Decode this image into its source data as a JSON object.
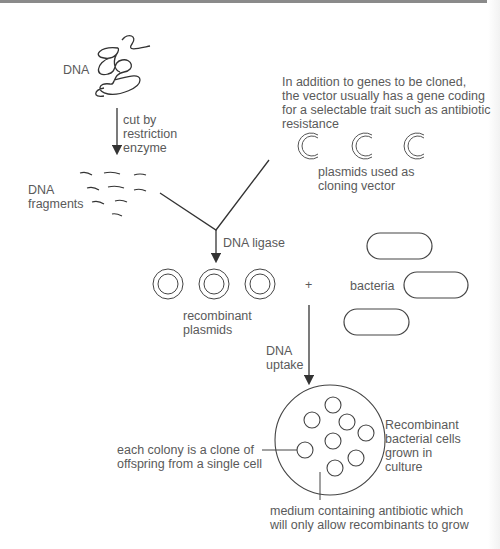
{
  "labels": {
    "dna": "DNA",
    "cut_step": "cut by\nrestriction\nenzyme",
    "dna_fragments": "DNA\nfragments",
    "vector_note": "In addition to genes to be cloned,\nthe vector usually has a gene coding\nfor a selectable trait such as antibiotic\nresistance",
    "plasmids_vector": "plasmids used as\ncloning vector",
    "ligase": "DNA ligase",
    "recombinant_plasmids": "recombinant\nplasmids",
    "plus": "+",
    "bacteria": "bacteria",
    "uptake": "DNA\nuptake",
    "colony_note": "each colony is a clone of\noffspring from a single cell",
    "culture_note": "Recombinant\nbacterial cells\ngrown in\nculture",
    "medium_note": "medium containing antibiotic which\nwill only allow recombinants to grow"
  },
  "colors": {
    "line": "#333333",
    "text": "#5a5a5a"
  }
}
